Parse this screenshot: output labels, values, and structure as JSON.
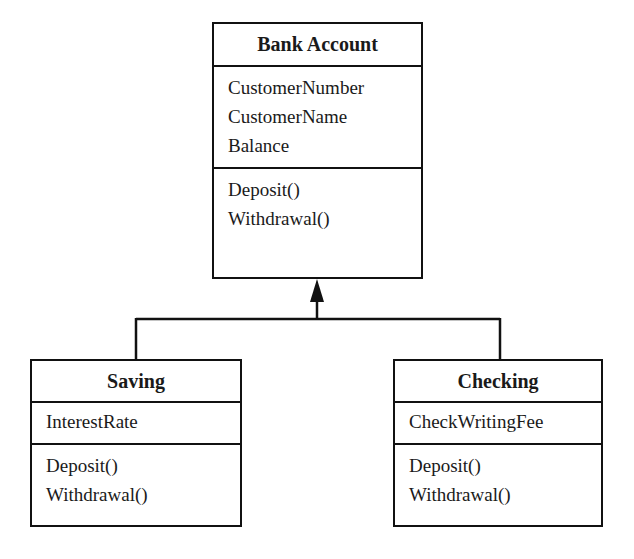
{
  "diagram": {
    "type": "UML class diagram",
    "classes": [
      {
        "name": "Bank Account",
        "attributes": [
          "CustomerNumber",
          "CustomerName",
          "Balance"
        ],
        "operations": [
          "Deposit()",
          "Withdrawal()"
        ]
      },
      {
        "name": "Saving",
        "attributes": [
          "InterestRate"
        ],
        "operations": [
          "Deposit()",
          "Withdrawal()"
        ]
      },
      {
        "name": "Checking",
        "attributes": [
          "CheckWritingFee"
        ],
        "operations": [
          "Deposit()",
          "Withdrawal()"
        ]
      }
    ],
    "relationships": [
      {
        "type": "generalization",
        "from": "Saving",
        "to": "Bank Account"
      },
      {
        "type": "generalization",
        "from": "Checking",
        "to": "Bank Account"
      }
    ],
    "colors": {
      "line": "#111111",
      "background": "#ffffff",
      "text": "#1a1a1a"
    }
  }
}
